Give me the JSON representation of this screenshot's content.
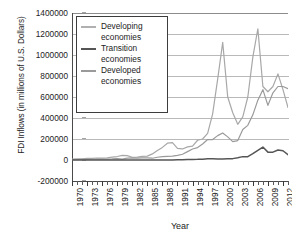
{
  "chart_data": {
    "type": "line",
    "title": "",
    "xlabel": "Year",
    "ylabel": "FDI Inflows (in millions of U.S. Dollars)",
    "ylim": [
      -200000,
      1400000
    ],
    "xlim": [
      1970,
      2013
    ],
    "ytick_step": 200000,
    "yticks": [
      -200000,
      0,
      200000,
      400000,
      600000,
      800000,
      1000000,
      1200000,
      1400000
    ],
    "ytick_labels": [
      "-200000",
      "0",
      "200000",
      "400000",
      "600000",
      "800000",
      "1000000",
      "1200000",
      "1400000"
    ],
    "xticks": [
      1970,
      1973,
      1976,
      1979,
      1982,
      1985,
      1988,
      1991,
      1994,
      1997,
      2000,
      2003,
      2006,
      2009,
      2012
    ],
    "xtick_labels": [
      "1970",
      "1973",
      "1976",
      "1979",
      "1982",
      "1985",
      "1988",
      "1991",
      "1994",
      "1997",
      "2000",
      "2003",
      "2006",
      "2009",
      "2012"
    ],
    "grid": true,
    "legend_position": "top-left",
    "x": [
      1970,
      1971,
      1972,
      1973,
      1974,
      1975,
      1976,
      1977,
      1978,
      1979,
      1980,
      1981,
      1982,
      1983,
      1984,
      1985,
      1986,
      1987,
      1988,
      1989,
      1990,
      1991,
      1992,
      1993,
      1994,
      1995,
      1996,
      1997,
      1998,
      1999,
      2000,
      2001,
      2002,
      2003,
      2004,
      2005,
      2006,
      2007,
      2008,
      2009,
      2010,
      2011,
      2012,
      2013
    ],
    "series": [
      {
        "name": "Developed economies",
        "color": "#a8a8a8",
        "values": [
          9000,
          10000,
          11000,
          16000,
          16000,
          19000,
          17000,
          21000,
          28000,
          33000,
          44000,
          42000,
          26000,
          28000,
          35000,
          37000,
          58000,
          91000,
          120000,
          160000,
          165000,
          110000,
          105000,
          125000,
          132000,
          188000,
          200000,
          253000,
          440000,
          770000,
          1120000,
          600000,
          450000,
          340000,
          410000,
          600000,
          980000,
          1250000,
          700000,
          650000,
          700000,
          820000,
          670000,
          500000
        ]
      },
      {
        "name": "Developing economies",
        "color": "#9a9a9a",
        "values": [
          4000,
          4500,
          5000,
          6500,
          7000,
          9000,
          7500,
          8500,
          10000,
          13000,
          8000,
          18000,
          20000,
          18000,
          20000,
          20000,
          17000,
          26000,
          32000,
          34000,
          37000,
          44000,
          55000,
          80000,
          105000,
          118000,
          152000,
          195000,
          195000,
          232000,
          258000,
          220000,
          175000,
          185000,
          290000,
          330000,
          430000,
          570000,
          670000,
          520000,
          640000,
          700000,
          700000,
          680000
        ]
      },
      {
        "name": "Transition economies",
        "color": "#555555",
        "values": [
          0,
          0,
          0,
          0,
          0,
          0,
          0,
          0,
          0,
          0,
          0,
          0,
          0,
          0,
          0,
          0,
          0,
          0,
          0,
          300,
          600,
          1500,
          3000,
          5000,
          5500,
          6000,
          8000,
          12000,
          11000,
          10000,
          9000,
          11000,
          13000,
          21000,
          32000,
          32000,
          60000,
          92000,
          123000,
          75000,
          75000,
          95000,
          88000,
          50000
        ]
      }
    ]
  },
  "legend": {
    "items": [
      {
        "label_line1": "Developing",
        "label_line2": "economies",
        "color": "#b0b0b0"
      },
      {
        "label_line1": "Transition",
        "label_line2": "economies",
        "color": "#555555"
      },
      {
        "label_line1": "Developed",
        "label_line2": "economies",
        "color": "#9a9a9a"
      }
    ]
  },
  "axis": {
    "x_title": "Year",
    "y_title": "FDI Inflows (in millions of U.S. Dollars)"
  }
}
